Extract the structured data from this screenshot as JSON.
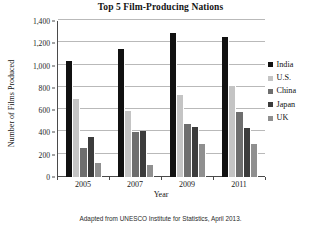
{
  "chart_data": {
    "type": "bar",
    "title": "Top 5 Film-Producing Nations",
    "xlabel": "Year",
    "ylabel": "Number of Films Produced",
    "categories": [
      "2005",
      "2007",
      "2009",
      "2011"
    ],
    "ylim": [
      0,
      1400
    ],
    "y_ticks": [
      "0",
      "200",
      "400",
      "600",
      "800",
      "1,000",
      "1,200",
      "1,400"
    ],
    "y_tick_values": [
      0,
      200,
      400,
      600,
      800,
      1000,
      1200,
      1400
    ],
    "grid": true,
    "legend_position": "right",
    "series": [
      {
        "name": "India",
        "color": "#111111",
        "values": [
          1040,
          1150,
          1290,
          1255
        ]
      },
      {
        "name": "U.S.",
        "color": "#c4c4c4",
        "values": [
          700,
          590,
          735,
          820
        ]
      },
      {
        "name": "China",
        "color": "#6e6e6e",
        "values": [
          260,
          400,
          475,
          580
        ]
      },
      {
        "name": "Japan",
        "color": "#3c3c3c",
        "values": [
          355,
          410,
          450,
          440
        ]
      },
      {
        "name": "UK",
        "color": "#8f8f8f",
        "values": [
          125,
          110,
          300,
          300
        ]
      }
    ]
  },
  "footnote": "Adapted from UNESCO Institute for Statistics, April 2013."
}
